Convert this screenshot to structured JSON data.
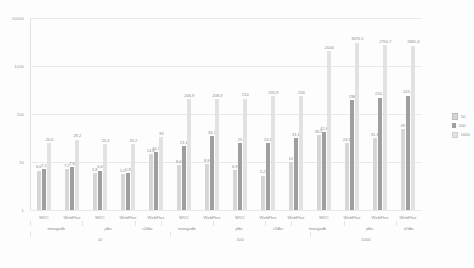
{
  "chart_data": {
    "type": "bar",
    "title": "",
    "xlabel": "",
    "ylabel": "",
    "yscale": "log",
    "ylim": [
      1,
      10000
    ],
    "ytick_labels": [
      "10000",
      "1000",
      "100",
      "10",
      "1"
    ],
    "grid": true,
    "legend_position": "right",
    "legend_title": "",
    "series": [
      {
        "name": "10",
        "values": [
          6.6,
          7.2,
          5.8,
          5.5,
          14.8,
          8.6,
          8.9,
          6.9,
          5.2,
          10,
          36.5,
          24.5,
          31.3,
          49
        ]
      },
      {
        "name": "100",
        "values": [
          7.1,
          7.8,
          6.6,
          5.9,
          16.1,
          21.6,
          34.1,
          25.0,
          24.6,
          31.8,
          42.8,
          198.0,
          220.5,
          241.8
        ]
      },
      {
        "name": "1000",
        "values": [
          24.6,
          29.2,
          23.3,
          23.2,
          33.0,
          206.9,
          208.3,
          210.0,
          235.9,
          234.0,
          235.5,
          278.9,
          1850.2,
          2665.4
        ]
      }
    ],
    "bar_labels_series0": [
      "6,6",
      "7,2",
      "5,8",
      "5,5",
      "14,8",
      "8,6",
      "8,9",
      "6,9",
      "5,2",
      "10",
      "36,5",
      "24,5",
      "31,3",
      "49"
    ],
    "bar_labels_series1": [
      "7,1",
      "7,8",
      "6,6",
      "5,9",
      "16,1",
      "21,6",
      "34,1",
      "25",
      "24,6",
      "31,8",
      "42,8",
      "198",
      "220,5",
      "241,8"
    ],
    "bar_labels_series2": [
      "24,6",
      "29,2",
      "23,3",
      "23,2",
      "33",
      "206,9",
      "208,3",
      "210",
      "235,9",
      "234",
      "235,5",
      "278,9",
      "1850,2",
      "2665,4"
    ],
    "bar_labels_overflow": [
      "2044",
      "3076,5",
      "2750,7"
    ],
    "categories": [
      "MVC",
      "WebFlux",
      "MVC",
      "WebFlux",
      "WebFlux",
      "MVC",
      "WebFlux",
      "MVC",
      "WebFlux",
      "WebFlux",
      "MVC",
      "WebFlux",
      "WebFlux",
      "WebFlux"
    ],
    "group_db": [
      {
        "label": "mongodb",
        "span": 2
      },
      {
        "label": "jdbc",
        "span": 2
      },
      {
        "label": "r2dbc",
        "span": 1
      },
      {
        "label": "mongodb",
        "span": 2
      },
      {
        "label": "jdbc",
        "span": 2
      },
      {
        "label": "r2dbc",
        "span": 1
      },
      {
        "label": "mongodb",
        "span": 2
      },
      {
        "label": "jdbc",
        "span": 2
      },
      {
        "label": "r2dbc",
        "span": 1
      }
    ],
    "group_concurrency": [
      {
        "label": "10",
        "span": 5
      },
      {
        "label": "100",
        "span": 5
      },
      {
        "label": "1000",
        "span": 4
      }
    ]
  },
  "legend": {
    "items": [
      {
        "label": "10"
      },
      {
        "label": "100"
      },
      {
        "label": "1000"
      }
    ]
  },
  "colors": {
    "series_10": "#d6d6d6",
    "series_100": "#9f9f9f",
    "series_1000": "#e2e2e2",
    "grid": "#e9e9e9",
    "text": "#8e8e8e",
    "background": "#fdfdfd"
  }
}
